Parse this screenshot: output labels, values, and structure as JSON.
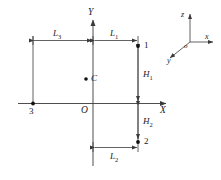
{
  "figure": {
    "colors": {
      "line": "#3a3a3a",
      "axis": "#3a3a3a",
      "marker": "#111111",
      "background": "#ffffff"
    },
    "axes": {
      "y_label": "Y",
      "x_label": "X",
      "origin_label": "O"
    },
    "dimensions": [
      {
        "name": "L3",
        "base": "L",
        "sub": "3",
        "orientation": "horizontal"
      },
      {
        "name": "L1",
        "base": "L",
        "sub": "1",
        "orientation": "horizontal"
      },
      {
        "name": "L2",
        "base": "L",
        "sub": "2",
        "orientation": "horizontal"
      },
      {
        "name": "H1",
        "base": "H",
        "sub": "1",
        "orientation": "vertical"
      },
      {
        "name": "H2",
        "base": "H",
        "sub": "2",
        "orientation": "vertical"
      }
    ],
    "nodes": [
      {
        "id": "1",
        "label": "1"
      },
      {
        "id": "2",
        "label": "2"
      },
      {
        "id": "3",
        "label": "3"
      }
    ],
    "centroid": {
      "label": "C"
    },
    "triad": {
      "z_label": "z",
      "x_label": "x",
      "y_label": "y",
      "origin_label": "o"
    }
  }
}
